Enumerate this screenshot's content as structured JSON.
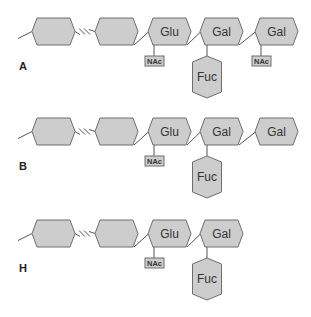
{
  "diagram": {
    "title": "",
    "colors": {
      "fill": "#cdcdcd",
      "stroke": "#6e6e6e",
      "text": "#333333"
    },
    "rows": [
      {
        "label": "A",
        "y": 18,
        "chain": [
          {
            "name": "",
            "x": 32
          },
          {
            "name": "",
            "x": 95
          },
          {
            "name": "Glu",
            "x": 148,
            "substituent": "NAc"
          },
          {
            "name": "Gal",
            "x": 200,
            "branch": "Fuc"
          },
          {
            "name": "Gal",
            "x": 255,
            "substituent": "NAc"
          }
        ]
      },
      {
        "label": "B",
        "y": 118,
        "chain": [
          {
            "name": "",
            "x": 32
          },
          {
            "name": "",
            "x": 95
          },
          {
            "name": "Glu",
            "x": 148,
            "substituent": "NAc"
          },
          {
            "name": "Gal",
            "x": 200,
            "branch": "Fuc"
          },
          {
            "name": "Gal",
            "x": 255
          }
        ]
      },
      {
        "label": "H",
        "y": 220,
        "chain": [
          {
            "name": "",
            "x": 32
          },
          {
            "name": "",
            "x": 95
          },
          {
            "name": "Glu",
            "x": 148,
            "substituent": "NAc"
          },
          {
            "name": "Gal",
            "x": 200,
            "branch": "Fuc"
          }
        ]
      }
    ]
  }
}
